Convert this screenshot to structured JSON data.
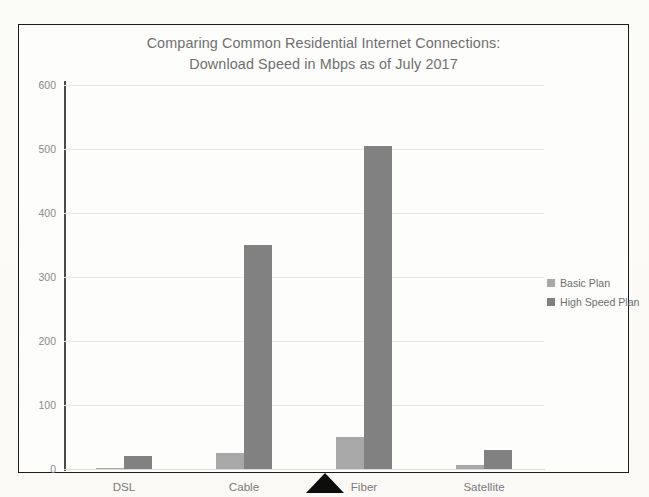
{
  "chart_data": {
    "type": "bar",
    "title": "Comparing Common Residential Internet Connections: Download Speed in Mbps as of July 2017",
    "title_lines": [
      "Comparing Common Residential Internet Connections:",
      "Download Speed in Mbps as of July 2017"
    ],
    "xlabel": "",
    "ylabel": "",
    "ylim": [
      0,
      600
    ],
    "ytick_step": 100,
    "yticks": [
      "600",
      "500",
      "400",
      "300",
      "200",
      "100",
      "0"
    ],
    "ytick_values": [
      600,
      500,
      400,
      300,
      200,
      100,
      0
    ],
    "grid": true,
    "legend_position": "right",
    "categories": [
      "DSL",
      "Cable",
      "Fiber",
      "Satellite"
    ],
    "series": [
      {
        "name": "Basic Plan",
        "color": "#a8a8a8",
        "values": [
          1,
          25,
          50,
          6
        ]
      },
      {
        "name": "High Speed Plan",
        "color": "#818181",
        "values": [
          20,
          350,
          505,
          30
        ]
      }
    ]
  },
  "legend": {
    "items": [
      {
        "label": "Basic Plan",
        "color": "#a8a8a8"
      },
      {
        "label": "High Speed Plan",
        "color": "#818181"
      }
    ]
  },
  "marker": {
    "name": "pointer-triangle",
    "color": "#0d0d0d"
  }
}
